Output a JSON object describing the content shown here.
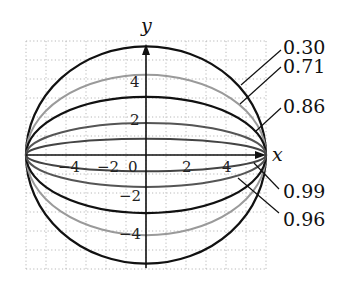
{
  "figure": {
    "type": "ellipses_same_major_axis",
    "axis_labels": {
      "x": "x",
      "y": "y"
    },
    "x_ticks": [
      "−4",
      "−2",
      "0",
      "2",
      "4"
    ],
    "y_ticks": [
      "4",
      "2",
      "−2",
      "−4"
    ],
    "grid": true,
    "semi_major_axis": 6
  },
  "chart_data": {
    "type": "line",
    "title": "",
    "xlabel": "x",
    "ylabel": "y",
    "xlim": [
      -6,
      6
    ],
    "ylim": [
      -6,
      6
    ],
    "grid": true,
    "x_tick_values": [
      -4,
      -2,
      0,
      2,
      4
    ],
    "y_tick_values": [
      -4,
      -2,
      2,
      4
    ],
    "series": [
      {
        "name": "0.30",
        "eccentricity": 0.3,
        "a": 6,
        "b": 5.72,
        "color": "#111111"
      },
      {
        "name": "0.71",
        "eccentricity": 0.71,
        "a": 6,
        "b": 4.22,
        "color": "#9a9a9a"
      },
      {
        "name": "0.86",
        "eccentricity": 0.86,
        "a": 6,
        "b": 3.06,
        "color": "#111111"
      },
      {
        "name": "0.96",
        "eccentricity": 0.96,
        "a": 6,
        "b": 1.68,
        "color": "#555555"
      },
      {
        "name": "0.99",
        "eccentricity": 0.99,
        "a": 6,
        "b": 0.85,
        "color": "#444444"
      }
    ]
  },
  "labels": [
    {
      "text": "0.30",
      "x": 283,
      "y": 54,
      "lx1": 281,
      "ly1": 50,
      "lx2": 241,
      "ly2": 85
    },
    {
      "text": "0.71",
      "x": 283,
      "y": 73,
      "lx1": 281,
      "ly1": 67,
      "lx2": 240,
      "ly2": 104
    },
    {
      "text": "0.86",
      "x": 283,
      "y": 113,
      "lx1": 281,
      "ly1": 108,
      "lx2": 256,
      "ly2": 131
    },
    {
      "text": "0.99",
      "x": 283,
      "y": 198,
      "lx1": 279,
      "ly1": 189,
      "lx2": 254,
      "ly2": 163
    },
    {
      "text": "0.96",
      "x": 283,
      "y": 226,
      "lx1": 279,
      "ly1": 213,
      "lx2": 238,
      "ly2": 178
    }
  ]
}
